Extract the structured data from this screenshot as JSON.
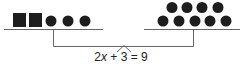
{
  "diagram": {
    "type": "balance-scale",
    "left_pan": {
      "squares": 2,
      "circles": 3
    },
    "right_pan": {
      "circles": 9,
      "rows": [
        4,
        5
      ]
    },
    "equation": {
      "coefficient": "2",
      "variable": "x",
      "rest": " + 3 = 9"
    },
    "colors": {
      "shape": "#1e1e1e",
      "line": "#666666"
    }
  }
}
